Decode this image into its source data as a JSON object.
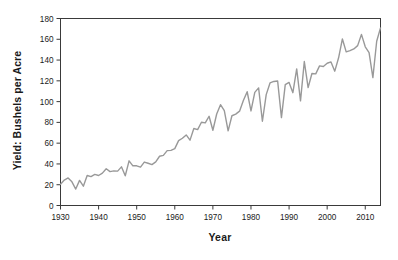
{
  "chart_data": {
    "type": "line",
    "title": "",
    "xlabel": "Year",
    "ylabel": "Yield: Bushels per Acre",
    "xlim": [
      1930,
      2014
    ],
    "ylim": [
      0,
      180
    ],
    "xticks": [
      1930,
      1940,
      1950,
      1960,
      1970,
      1980,
      1990,
      2000,
      2010
    ],
    "yticks": [
      0,
      20,
      40,
      60,
      80,
      100,
      120,
      140,
      160,
      180
    ],
    "xtick_labels": [
      "1930",
      "1940",
      "1950",
      "1960",
      "1970",
      "1980",
      "1990",
      "2000",
      "2010"
    ],
    "ytick_labels": [
      "0",
      "20",
      "40",
      "60",
      "80",
      "100",
      "120",
      "140",
      "160",
      "180"
    ],
    "grid": false,
    "legend": false,
    "line_color": "#999999",
    "axis_color": "#404040",
    "background": "#ffffff",
    "series": [
      {
        "name": "Yield",
        "x": [
          1930,
          1931,
          1932,
          1933,
          1934,
          1935,
          1936,
          1937,
          1938,
          1939,
          1940,
          1941,
          1942,
          1943,
          1944,
          1945,
          1946,
          1947,
          1948,
          1949,
          1950,
          1951,
          1952,
          1953,
          1954,
          1955,
          1956,
          1957,
          1958,
          1959,
          1960,
          1961,
          1962,
          1963,
          1964,
          1965,
          1966,
          1967,
          1968,
          1969,
          1970,
          1971,
          1972,
          1973,
          1974,
          1975,
          1976,
          1977,
          1978,
          1979,
          1980,
          1981,
          1982,
          1983,
          1984,
          1985,
          1986,
          1987,
          1988,
          1989,
          1990,
          1991,
          1992,
          1993,
          1994,
          1995,
          1996,
          1997,
          1998,
          1999,
          2000,
          2001,
          2002,
          2003,
          2004,
          2005,
          2006,
          2007,
          2008,
          2009,
          2010,
          2011,
          2012,
          2013,
          2014
        ],
        "values": [
          20.5,
          24.5,
          26.5,
          22.8,
          15.8,
          24.2,
          18.6,
          28.9,
          27.8,
          29.9,
          28.9,
          31.2,
          35.4,
          32.6,
          33.3,
          33.1,
          37.2,
          28.6,
          43.0,
          38.2,
          38.2,
          36.9,
          41.8,
          40.7,
          39.4,
          42.0,
          47.4,
          48.3,
          52.8,
          53.1,
          54.7,
          62.4,
          64.7,
          67.9,
          62.9,
          74.1,
          73.1,
          80.1,
          79.5,
          85.9,
          72.4,
          88.1,
          97.0,
          91.3,
          71.9,
          86.4,
          88.0,
          90.8,
          101.0,
          109.5,
          91.0,
          108.9,
          113.2,
          81.1,
          106.7,
          118.0,
          119.4,
          119.8,
          84.6,
          116.3,
          118.5,
          108.6,
          131.5,
          100.7,
          138.6,
          113.5,
          127.1,
          126.7,
          134.4,
          133.8,
          136.9,
          138.2,
          129.3,
          142.2,
          160.3,
          147.9,
          149.1,
          150.7,
          153.9,
          164.7,
          152.8,
          147.2,
          123.1,
          158.1,
          171.0
        ]
      }
    ]
  },
  "axes": {
    "ylabel_text": "Yield: Bushels per Acre",
    "xlabel_text": "Year"
  }
}
